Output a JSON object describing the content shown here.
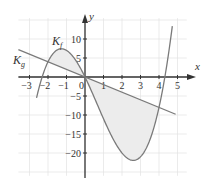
{
  "chart_data": {
    "type": "line",
    "title": "",
    "xlabel": "x",
    "ylabel": "y",
    "xlim": [
      -3.6,
      5.8
    ],
    "ylim": [
      -26.5,
      16
    ],
    "grid": true,
    "x_ticks": [
      -3,
      -2,
      -1,
      1,
      2,
      3,
      4,
      5
    ],
    "x_tick_labels": [
      "−3",
      "−2",
      "−1",
      "1",
      "2",
      "3",
      "4",
      "5"
    ],
    "y_ticks": [
      10,
      5,
      -5,
      -10,
      -15,
      -20
    ],
    "y_tick_labels": [
      "10",
      "5",
      "−5",
      "−10",
      "−15",
      "−20"
    ],
    "origin_label": "0",
    "series": [
      {
        "name": "K_f",
        "label_main": "K",
        "label_sub": "f",
        "formula": "f(x) = x^3 - 2x^2 - 10x",
        "x": [
          -2.6,
          -2.32,
          -2,
          -1.43,
          -1,
          0,
          1,
          2,
          2.77,
          3,
          4,
          4.32,
          4.7
        ],
        "y": [
          -8.9,
          0,
          4,
          7.3,
          7,
          0,
          -11,
          -20,
          -21.7,
          -21,
          -8,
          0,
          15.2
        ]
      },
      {
        "name": "K_g",
        "label_main": "K",
        "label_sub": "g",
        "formula": "g(x) = -2x",
        "x": [
          -3.6,
          4.9
        ],
        "y": [
          7.2,
          -9.8
        ]
      }
    ],
    "intersections": [
      {
        "x": -2,
        "y": 4
      },
      {
        "x": 0,
        "y": 0
      },
      {
        "x": 4,
        "y": -8
      }
    ],
    "shaded_regions": [
      {
        "from_x": -2,
        "to_x": 0,
        "between": [
          "K_f",
          "K_g"
        ]
      },
      {
        "from_x": 0,
        "to_x": 4,
        "between": [
          "K_g",
          "K_f"
        ]
      }
    ],
    "colors": {
      "curve": "#7a7a7a",
      "line": "#7a7a7a",
      "axis": "#333333",
      "grid": "#e2e2e2",
      "fill": "#ececec"
    }
  }
}
